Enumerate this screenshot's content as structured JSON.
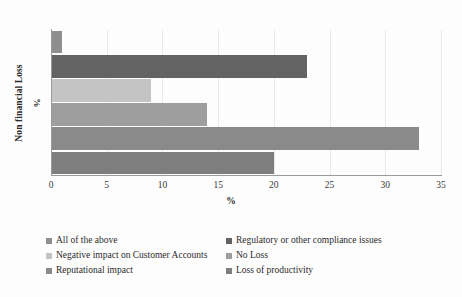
{
  "chart_data": {
    "type": "bar",
    "orientation": "horizontal",
    "title": "",
    "xlabel": "%",
    "ylabel": "Non financial Loss",
    "ylabel_unit": "%",
    "xlim": [
      0,
      35
    ],
    "xticks": [
      0,
      5,
      10,
      15,
      20,
      25,
      30,
      35
    ],
    "xtick_labels": [
      "0",
      "5",
      "10",
      "15",
      "20",
      "25",
      "30",
      "35"
    ],
    "grid": true,
    "legend_position": "bottom",
    "categories": [
      "All of the above",
      "Regulatory or other compliance issues",
      "Negative impact on Customer Accounts",
      "No Loss",
      "Reputational impact",
      "Loss of productivity"
    ],
    "values": [
      1,
      23,
      9,
      14,
      33,
      20
    ],
    "colors": [
      "#8e8e8e",
      "#636363",
      "#c4c4c4",
      "#9e9e9e",
      "#8a8a8a",
      "#7e7e7e"
    ],
    "series": [
      {
        "name": "Non financial Loss",
        "values": [
          1,
          23,
          9,
          14,
          33,
          20
        ]
      }
    ]
  },
  "axes": {
    "y_title": "Non financial Loss",
    "y_unit": "%",
    "x_title": "%"
  },
  "legend": {
    "items": [
      {
        "label": "All of the above",
        "color": "#8e8e8e"
      },
      {
        "label": "Regulatory or other compliance issues",
        "color": "#636363"
      },
      {
        "label": "Negative impact on Customer Accounts",
        "color": "#c4c4c4"
      },
      {
        "label": "No Loss",
        "color": "#9e9e9e"
      },
      {
        "label": "Reputational impact",
        "color": "#8a8a8a"
      },
      {
        "label": "Loss of productivity",
        "color": "#7e7e7e"
      }
    ]
  }
}
